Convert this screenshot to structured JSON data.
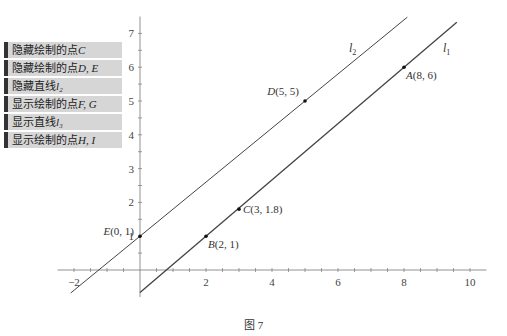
{
  "menu": {
    "items": [
      {
        "label": "隐藏绘制的点",
        "var": "C"
      },
      {
        "label": "隐藏绘制的点",
        "var": "D, E"
      },
      {
        "label": "隐藏直线",
        "var": "l₂"
      },
      {
        "label": "显示绘制的点",
        "var": "F, G"
      },
      {
        "label": "显示直线",
        "var": "l₃"
      },
      {
        "label": "显示绘制的点",
        "var": "H, I"
      }
    ]
  },
  "axes": {
    "x_ticks": [
      -2,
      2,
      4,
      6,
      8,
      10
    ],
    "y_ticks": [
      1,
      2,
      3,
      4,
      5,
      6,
      7
    ],
    "x_range": [
      -2.5,
      10.5
    ],
    "y_range": [
      -0.8,
      7.5
    ]
  },
  "points": [
    {
      "name": "A",
      "x": 8,
      "y": 6,
      "label": "A(8, 6)",
      "anchor": "below-right"
    },
    {
      "name": "B",
      "x": 2,
      "y": 1,
      "label": "B(2, 1)",
      "anchor": "below-right"
    },
    {
      "name": "C",
      "x": 3,
      "y": 1.8,
      "label": "C(3, 1.8)",
      "anchor": "right"
    },
    {
      "name": "D",
      "x": 5,
      "y": 5,
      "label": "D(5, 5)",
      "anchor": "above-left"
    },
    {
      "name": "E",
      "x": 0,
      "y": 1,
      "label": "E(0, 1)",
      "anchor": "left"
    }
  ],
  "lines": [
    {
      "name": "l1",
      "label": "l",
      "sub": "1",
      "through": [
        [
          2,
          1
        ],
        [
          8,
          6
        ]
      ],
      "x_from": 0,
      "x_to": 9.6
    },
    {
      "name": "l2",
      "label": "l",
      "sub": "2",
      "through": [
        [
          0,
          1
        ],
        [
          5,
          5
        ]
      ],
      "x_from": -2.1,
      "x_to": 8.1
    }
  ],
  "caption": "图 7"
}
